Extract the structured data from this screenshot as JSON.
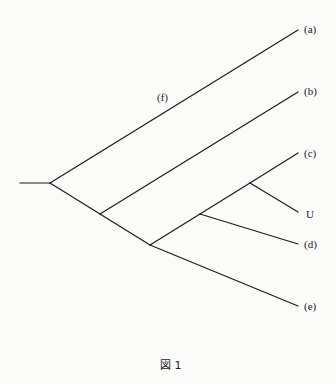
{
  "diagram": {
    "type": "phylogenetic-tree",
    "caption": "図 1",
    "internal_label": "(f)",
    "tips": [
      {
        "id": "a",
        "label": "(a)"
      },
      {
        "id": "b",
        "label": "(b)"
      },
      {
        "id": "c",
        "label": "(c)"
      },
      {
        "id": "U",
        "label": "U"
      },
      {
        "id": "d",
        "label": "(d)"
      },
      {
        "id": "e",
        "label": "(e)"
      }
    ],
    "topology": "(a,(b,(((c,U),d),e)))",
    "line_color": "#1c1c1c",
    "background_color": "#fbfbfa"
  }
}
